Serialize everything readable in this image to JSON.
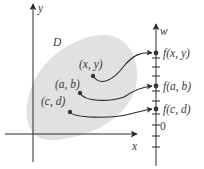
{
  "figure": {
    "region_label": "D",
    "axes": {
      "x_label": "x",
      "y_label": "y",
      "w_label": "w",
      "w_zero_label": "0"
    },
    "points": [
      {
        "label": "(x, y)",
        "maps_to": "f(x, y)"
      },
      {
        "label": "(a, b)",
        "maps_to": "f(a, b)"
      },
      {
        "label": "(c, d)",
        "maps_to": "f(c, d)"
      }
    ],
    "colors": {
      "region_fill": "#e1e1e1",
      "ink": "#3a3a3a"
    }
  }
}
